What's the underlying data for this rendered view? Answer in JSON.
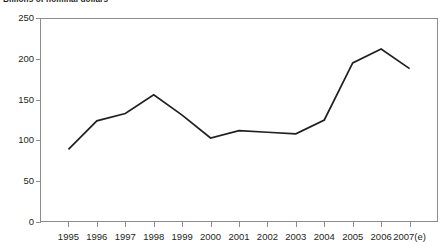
{
  "chart_title": "Billions of nominal dollars",
  "chart_data": {
    "type": "line",
    "title": "Billions of nominal dollars",
    "xlabel": "",
    "ylabel": "",
    "categories": [
      "1995",
      "1996",
      "1997",
      "1998",
      "1999",
      "2000",
      "2001",
      "2002",
      "2003",
      "2004",
      "2005",
      "2006",
      "2007(e)"
    ],
    "values": [
      89,
      124,
      133,
      156,
      131,
      103,
      112,
      110,
      108,
      125,
      195,
      212,
      188
    ],
    "series": [
      {
        "name": "Value",
        "values": [
          89,
          124,
          133,
          156,
          131,
          103,
          112,
          110,
          108,
          125,
          195,
          212,
          188
        ]
      }
    ],
    "ylim": [
      0,
      250
    ],
    "yticks": [
      0,
      50,
      100,
      150,
      200,
      250
    ],
    "ytick_labels": [
      "0",
      "50",
      "100",
      "150",
      "200",
      "250"
    ],
    "grid": false,
    "legend": "none",
    "line_color": "#231f20"
  },
  "axis": {
    "y_labels": [
      "250",
      "200",
      "150",
      "100",
      "50",
      "0"
    ],
    "x_labels": [
      "1995",
      "1996",
      "1997",
      "1998",
      "1999",
      "2000",
      "2001",
      "2002",
      "2003",
      "2004",
      "2005",
      "2006",
      "2007(e)"
    ]
  }
}
